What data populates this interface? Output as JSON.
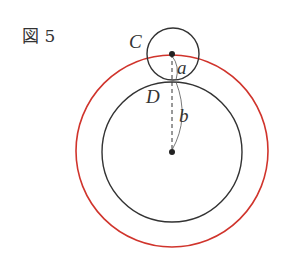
{
  "figure": {
    "label": "図 5",
    "points": {
      "C": "C",
      "D": "D",
      "a": "a",
      "b": "b"
    },
    "colors": {
      "circles": "#333333",
      "outer_circle": "#d0342c",
      "background": "#ffffff"
    },
    "circles": {
      "small_C": {
        "cx": 173,
        "cy": 54,
        "r": 26
      },
      "inner_D": {
        "cx": 172,
        "cy": 152,
        "r": 70
      },
      "outer_red": {
        "cx": 172,
        "cy": 151,
        "r": 96
      }
    }
  }
}
